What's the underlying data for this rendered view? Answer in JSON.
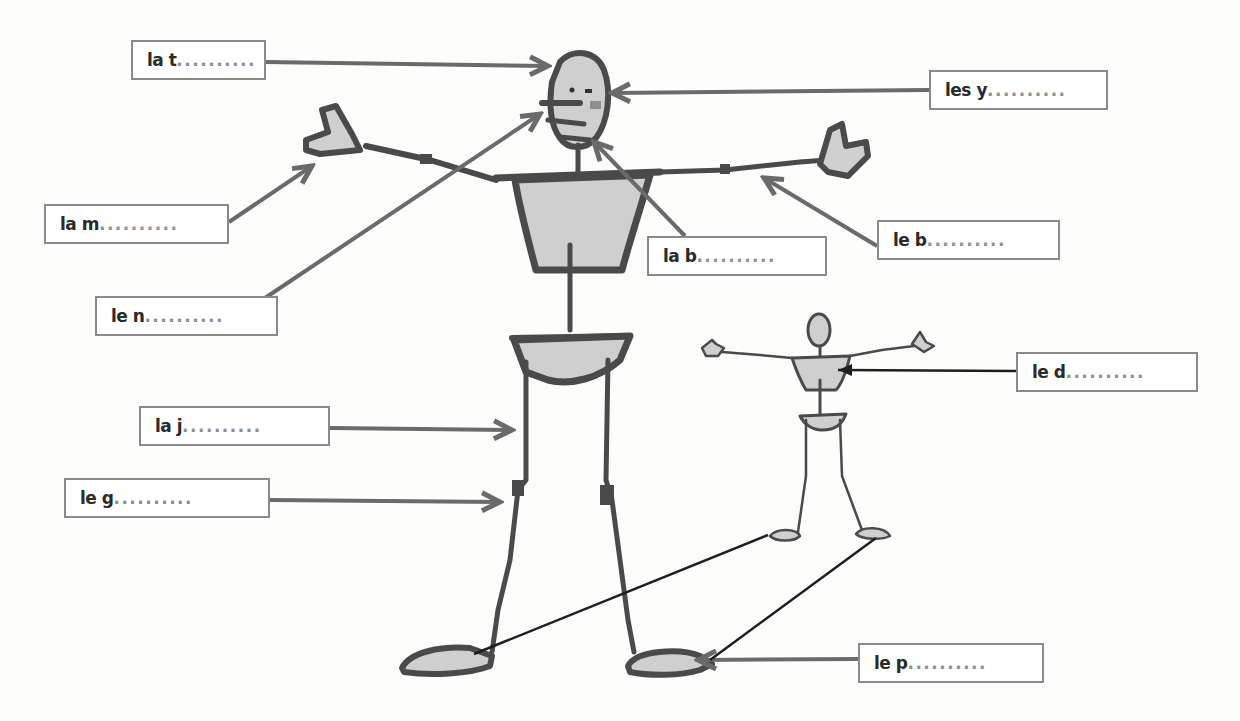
{
  "worksheet": {
    "topic": "body parts labeling",
    "labels": [
      {
        "id": "head",
        "prefix": "la t",
        "blank": "..........",
        "x": 131,
        "y": 40,
        "w": 135
      },
      {
        "id": "eyes",
        "prefix": "les y",
        "blank": "..........",
        "x": 929,
        "y": 70,
        "w": 179
      },
      {
        "id": "hand",
        "prefix": "la m",
        "blank": "..........",
        "x": 44,
        "y": 204,
        "w": 185
      },
      {
        "id": "mouth",
        "prefix": "la b",
        "blank": "..........",
        "x": 647,
        "y": 236,
        "w": 180
      },
      {
        "id": "arm",
        "prefix": "le b",
        "blank": "..........",
        "x": 877,
        "y": 220,
        "w": 183
      },
      {
        "id": "nose",
        "prefix": "le n",
        "blank": "..........",
        "x": 95,
        "y": 296,
        "w": 183
      },
      {
        "id": "back",
        "prefix": "le d",
        "blank": "..........",
        "x": 1016,
        "y": 352,
        "w": 182
      },
      {
        "id": "leg",
        "prefix": "la j",
        "blank": "..........",
        "x": 139,
        "y": 406,
        "w": 191
      },
      {
        "id": "knee",
        "prefix": "le g",
        "blank": "..........",
        "x": 64,
        "y": 478,
        "w": 206
      },
      {
        "id": "foot",
        "prefix": "le p",
        "blank": "..........",
        "x": 858,
        "y": 643,
        "w": 186
      }
    ]
  },
  "colors": {
    "outline": "#4a4a4a",
    "fill": "#cfcfcf",
    "arrow": "#6a6a6a",
    "line_dark": "#1e1e1e",
    "cheek": "#8f8f8f",
    "box_border": "#8a8a8a"
  }
}
